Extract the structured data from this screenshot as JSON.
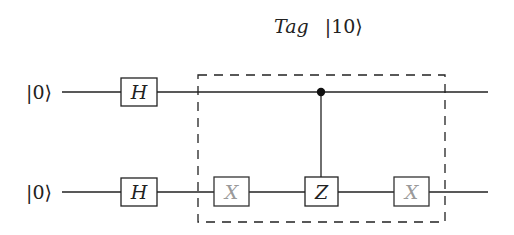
{
  "diagram": {
    "type": "quantum-circuit",
    "title": "Tag |10⟩",
    "title_italic": "Tag",
    "title_ket": "|10⟩",
    "qubits": [
      {
        "input": "|0⟩",
        "y": 92
      },
      {
        "input": "|0⟩",
        "y": 192
      }
    ],
    "gates": [
      {
        "label": "H",
        "qubit": 0,
        "x": 121,
        "w": 36,
        "style": "normal"
      },
      {
        "label": "H",
        "qubit": 1,
        "x": 121,
        "w": 36,
        "style": "normal"
      },
      {
        "label": "X",
        "qubit": 1,
        "x": 214,
        "w": 35,
        "style": "gray"
      },
      {
        "label": "Z",
        "qubit": 1,
        "x": 305,
        "w": 33,
        "style": "normal"
      },
      {
        "label": "X",
        "qubit": 1,
        "x": 394,
        "w": 35,
        "style": "gray"
      }
    ],
    "controls": [
      {
        "control_qubit": 0,
        "target_qubit": 1,
        "x": 321,
        "target_gate": "Z"
      }
    ],
    "oracle_box": {
      "label": "Tag |10⟩",
      "x": 198,
      "y": 75,
      "w": 247,
      "h": 147,
      "style": "dashed"
    },
    "colors": {
      "line": "#222222",
      "gray_text": "#9a9a9a",
      "text": "#222222"
    }
  }
}
